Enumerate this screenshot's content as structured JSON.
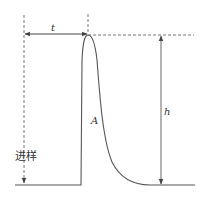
{
  "diagram": {
    "type": "chromatogram-peak",
    "labels": {
      "retention_time": "t",
      "peak_height": "h",
      "peak_area": "A",
      "injection": "进样"
    },
    "colors": {
      "line": "#555555",
      "dashed": "#777777",
      "text": "#333333"
    }
  }
}
